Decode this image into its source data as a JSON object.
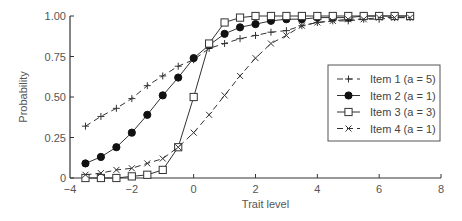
{
  "chart_data": {
    "type": "line",
    "title": "",
    "xlabel": "Trait level",
    "ylabel": "Probability",
    "xlim": [
      -4,
      8
    ],
    "ylim": [
      0,
      1
    ],
    "xticks": [
      -4,
      -2,
      0,
      2,
      4,
      6,
      8
    ],
    "xtick_labels": [
      "−4",
      "−2",
      "0",
      "2",
      "4",
      "6",
      "8"
    ],
    "yticks": [
      0,
      0.25,
      0.5,
      0.75,
      1.0
    ],
    "ytick_labels": [
      "0",
      "0.25",
      "0.50",
      "0.75",
      "1.00"
    ],
    "grid": false,
    "legend_position": "right",
    "x": [
      -3.5,
      -3.0,
      -2.5,
      -2.0,
      -1.5,
      -1.0,
      -0.5,
      0.0,
      0.5,
      1.0,
      1.5,
      2.0,
      2.5,
      3.0,
      3.5,
      4.0,
      4.5,
      5.0,
      5.5,
      6.0,
      6.5,
      7.0
    ],
    "series": [
      {
        "name": "Item 1 (a = 5)",
        "marker": "plus",
        "line": "dashed",
        "values": [
          0.32,
          0.38,
          0.43,
          0.49,
          0.57,
          0.63,
          0.69,
          0.73,
          0.8,
          0.83,
          0.86,
          0.88,
          0.9,
          0.91,
          0.94,
          0.96,
          0.97,
          0.97,
          0.98,
          0.98,
          0.99,
          0.99
        ]
      },
      {
        "name": "Item 2 (a = 1)",
        "marker": "filled-circle",
        "line": "solid",
        "values": [
          0.09,
          0.13,
          0.19,
          0.28,
          0.39,
          0.51,
          0.62,
          0.74,
          0.82,
          0.89,
          0.93,
          0.95,
          0.97,
          0.98,
          0.98,
          0.99,
          0.99,
          0.99,
          1.0,
          1.0,
          1.0,
          1.0
        ]
      },
      {
        "name": "Item 3 (a = 3)",
        "marker": "open-square",
        "line": "solid",
        "values": [
          0.0,
          0.0,
          0.0,
          0.01,
          0.02,
          0.05,
          0.19,
          0.5,
          0.83,
          0.96,
          0.99,
          1.0,
          1.0,
          1.0,
          1.0,
          1.0,
          1.0,
          1.0,
          1.0,
          1.0,
          1.0,
          1.0
        ]
      },
      {
        "name": "Item 4 (a = 1)",
        "marker": "x",
        "line": "dashed",
        "values": [
          0.02,
          0.03,
          0.05,
          0.06,
          0.09,
          0.12,
          0.19,
          0.28,
          0.39,
          0.51,
          0.63,
          0.74,
          0.83,
          0.88,
          0.94,
          0.96,
          0.97,
          0.98,
          0.98,
          0.99,
          0.99,
          0.99
        ]
      }
    ]
  },
  "colors": {
    "axis": "#333333",
    "series": "#333333",
    "text": "#555555"
  }
}
